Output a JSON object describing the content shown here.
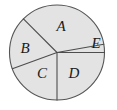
{
  "figure": {
    "type": "pie-diagram",
    "background_color": "#ffffff",
    "circle": {
      "center_x": 57,
      "center_y": 52.5,
      "radius": 47.5,
      "fill_color": "#e3e3e3",
      "stroke_color": "#555555",
      "stroke_width": 1.1
    },
    "divider": {
      "stroke_color": "#4d4d4d",
      "stroke_width": 1.1
    }
  },
  "chart_data": {
    "type": "pie",
    "title": "",
    "categories": [
      "A",
      "B",
      "C",
      "D",
      "E"
    ],
    "values": [
      125,
      65,
      70,
      90,
      10
    ],
    "unit": "degrees",
    "legend": "none",
    "labels_inside": true,
    "sectors": [
      {
        "name": "A",
        "start_angle": 10,
        "end_angle": 135,
        "sweep": 125,
        "label": "A",
        "label_x": 61,
        "label_y": 28
      },
      {
        "name": "B",
        "start_angle": 135,
        "end_angle": 200,
        "sweep": 65,
        "label": "B",
        "label_x": 25,
        "label_y": 50
      },
      {
        "name": "C",
        "start_angle": 200,
        "end_angle": 270,
        "sweep": 70,
        "label": "C",
        "label_x": 42,
        "label_y": 75
      },
      {
        "name": "D",
        "start_angle": 270,
        "end_angle": 360,
        "sweep": 90,
        "label": "D",
        "label_x": 74,
        "label_y": 75
      },
      {
        "name": "E",
        "start_angle": 0,
        "end_angle": 10,
        "sweep": 10,
        "label": "E",
        "label_x": 96,
        "label_y": 45
      }
    ]
  }
}
